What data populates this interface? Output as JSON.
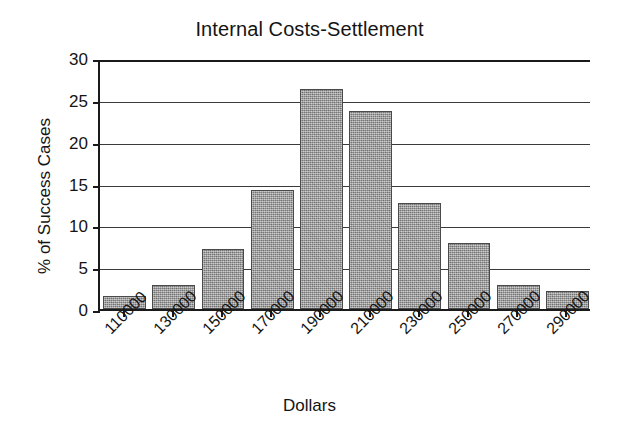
{
  "chart_data": {
    "type": "bar",
    "title": "Internal Costs-Settlement",
    "xlabel": "Dollars",
    "ylabel": "% of Success Cases",
    "categories": [
      "110000",
      "130000",
      "150000",
      "170000",
      "190000",
      "210000",
      "230000",
      "250000",
      "270000",
      "290000"
    ],
    "values": [
      1.5,
      2.9,
      7.2,
      14.2,
      26.3,
      23.7,
      12.7,
      7.9,
      2.9,
      2.2
    ],
    "ylim": [
      0,
      30
    ],
    "ytick_labels": [
      "30",
      "25",
      "20",
      "15",
      "10",
      "5",
      "0"
    ],
    "ytick_values": [
      30,
      25,
      20,
      15,
      10,
      5,
      0
    ],
    "grid": true,
    "legend": "none",
    "bar_color": "#9d9d9d",
    "bar_border_color": "#4a4a4a",
    "axis_color": "#1a1a1a",
    "background_color": "#ffffff"
  }
}
